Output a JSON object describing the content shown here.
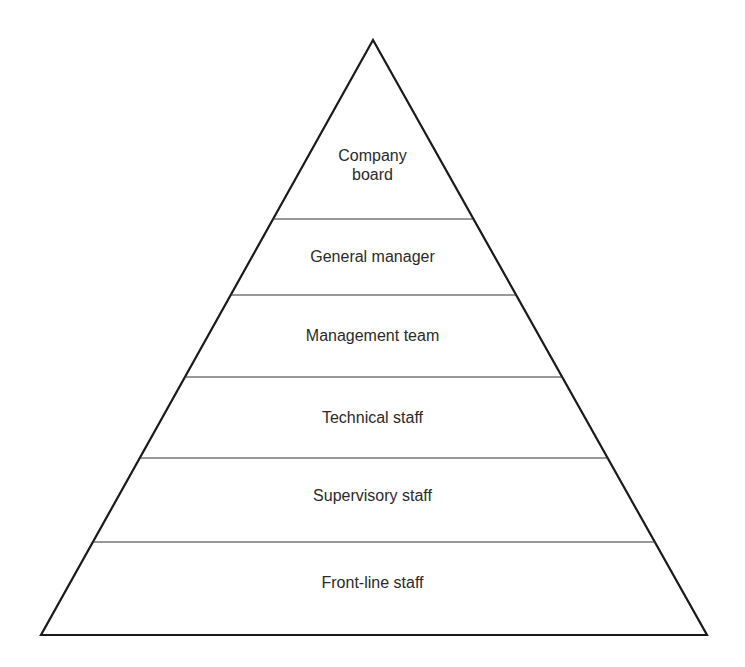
{
  "diagram": {
    "type": "hierarchy-pyramid",
    "stroke_color": "#1a1a1a",
    "text_color": "#2a2a2a",
    "background": "#ffffff",
    "levels": [
      {
        "label_lines": [
          "Company",
          "board"
        ],
        "label": "Company board"
      },
      {
        "label_lines": [
          "General manager"
        ],
        "label": "General manager"
      },
      {
        "label_lines": [
          "Management team"
        ],
        "label": "Management team"
      },
      {
        "label_lines": [
          "Technical staff"
        ],
        "label": "Technical staff"
      },
      {
        "label_lines": [
          "Supervisory staff"
        ],
        "label": "Supervisory staff"
      },
      {
        "label_lines": [
          "Front-line staff"
        ],
        "label": "Front-line staff"
      }
    ]
  }
}
